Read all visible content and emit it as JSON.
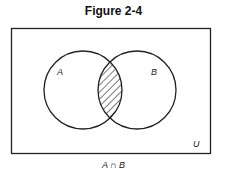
{
  "figure": {
    "title": "Figure 2-4",
    "caption": "A ∩ B",
    "universe_label": "U",
    "sets": [
      {
        "label": "A"
      },
      {
        "label": "B"
      }
    ],
    "shaded_region": "intersection of A and B",
    "colors": {
      "stroke": "#222222",
      "background": "#ffffff"
    }
  }
}
